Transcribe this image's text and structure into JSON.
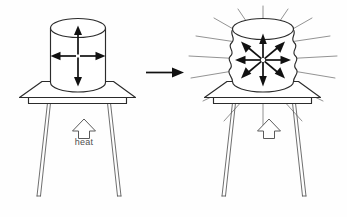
{
  "figure": {
    "background_color": "#fefefe",
    "width": 347,
    "height": 217,
    "line_color": "#2b2b2b",
    "ray_color": "#777777",
    "arrow_color": "#111111"
  },
  "panels": {
    "left": {
      "name": "before-heating",
      "caption": "heat",
      "cylinder": {
        "state": "smooth",
        "expansion_arrows": 4,
        "arrow_directions": [
          "up",
          "down",
          "left",
          "right"
        ]
      },
      "table": {
        "legs": 2
      },
      "heat_source": {
        "label": "heat",
        "direction": "up",
        "style": "hollow-outline-arrow"
      }
    },
    "right": {
      "name": "after-heating",
      "caption": "",
      "cylinder": {
        "state": "expanding-wavy",
        "expansion_arrows": 8,
        "arrow_directions": [
          "up",
          "down",
          "left",
          "right",
          "up-left",
          "up-right",
          "down-left",
          "down-right"
        ],
        "radiating_rays": 16
      },
      "table": {
        "legs": 2
      },
      "heat_source": {
        "label": "",
        "direction": "up",
        "style": "hollow-outline-arrow"
      }
    }
  },
  "transition": {
    "name": "process-arrow",
    "direction": "right",
    "label": ""
  }
}
